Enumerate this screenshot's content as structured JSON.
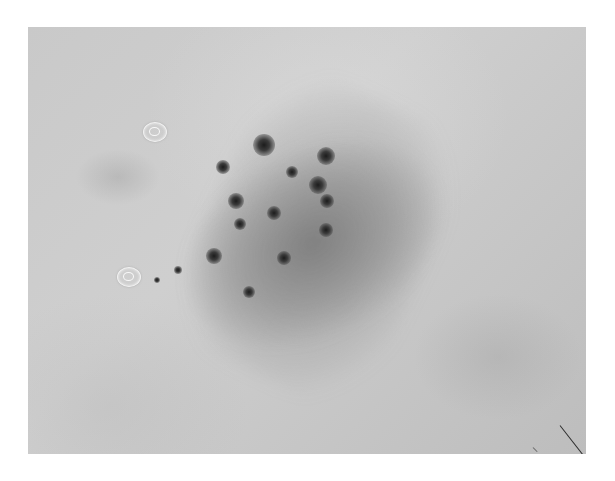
{
  "image": {
    "description": "Grayscale dermoscopy image of a pigmented skin lesion with scattered dark dots/globules on a diffuse gray patch",
    "background_color": "#ffffff",
    "skin_tone": "#c9c9c9",
    "lesion_tone": "#8a8a8a",
    "dot_color": "#1c1c1c"
  },
  "dots": [
    {
      "x": 264,
      "y": 145,
      "r": 11
    },
    {
      "x": 326,
      "y": 156,
      "r": 9
    },
    {
      "x": 318,
      "y": 185,
      "r": 9
    },
    {
      "x": 292,
      "y": 172,
      "r": 6
    },
    {
      "x": 223,
      "y": 167,
      "r": 7
    },
    {
      "x": 236,
      "y": 201,
      "r": 8
    },
    {
      "x": 274,
      "y": 213,
      "r": 7
    },
    {
      "x": 240,
      "y": 224,
      "r": 6
    },
    {
      "x": 327,
      "y": 201,
      "r": 7
    },
    {
      "x": 326,
      "y": 230,
      "r": 7
    },
    {
      "x": 214,
      "y": 256,
      "r": 8
    },
    {
      "x": 284,
      "y": 258,
      "r": 7
    },
    {
      "x": 249,
      "y": 292,
      "r": 6
    },
    {
      "x": 178,
      "y": 270,
      "r": 4
    },
    {
      "x": 157,
      "y": 280,
      "r": 3
    }
  ],
  "bubbles": [
    {
      "x": 115,
      "y": 95
    },
    {
      "x": 89,
      "y": 240
    }
  ]
}
